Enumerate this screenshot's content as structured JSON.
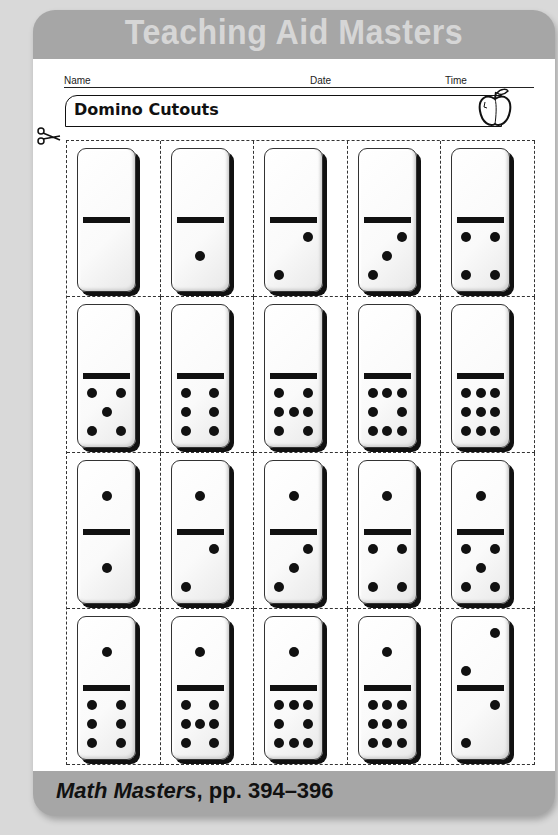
{
  "header": {
    "title": "Teaching Aid Masters"
  },
  "meta": {
    "name_label": "Name",
    "date_label": "Date",
    "time_label": "Time"
  },
  "worksheet": {
    "title": "Domino Cutouts",
    "icons": [
      "apple-icon",
      "scissors-icon"
    ]
  },
  "dominoes": [
    {
      "top": 0,
      "bottom": 0
    },
    {
      "top": 0,
      "bottom": 1
    },
    {
      "top": 0,
      "bottom": 2
    },
    {
      "top": 0,
      "bottom": 3
    },
    {
      "top": 0,
      "bottom": 4
    },
    {
      "top": 0,
      "bottom": 5
    },
    {
      "top": 0,
      "bottom": 6
    },
    {
      "top": 0,
      "bottom": 7
    },
    {
      "top": 0,
      "bottom": 8
    },
    {
      "top": 0,
      "bottom": 9
    },
    {
      "top": 1,
      "bottom": 1
    },
    {
      "top": 1,
      "bottom": 2
    },
    {
      "top": 1,
      "bottom": 3
    },
    {
      "top": 1,
      "bottom": 4
    },
    {
      "top": 1,
      "bottom": 5
    },
    {
      "top": 1,
      "bottom": 6
    },
    {
      "top": 1,
      "bottom": 7
    },
    {
      "top": 1,
      "bottom": 8
    },
    {
      "top": 1,
      "bottom": 9
    },
    {
      "top": 2,
      "bottom": 2
    }
  ],
  "footer": {
    "book": "Math Masters",
    "pages": ", pp. 394–396"
  },
  "colors": {
    "band": "#a6a6a6",
    "header_text": "#d6d6d6",
    "background": "#d9d9d9"
  }
}
